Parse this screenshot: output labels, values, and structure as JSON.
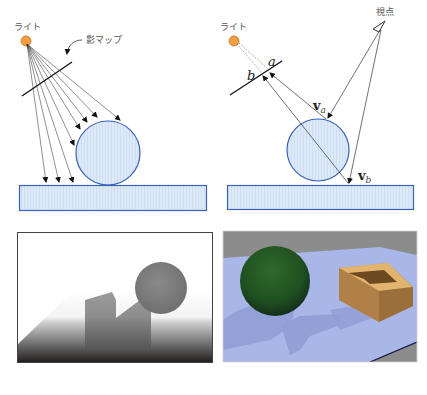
{
  "figure": {
    "top_left": {
      "light_label": "ライト",
      "shadow_map_label": "影マップ"
    },
    "top_right": {
      "light_label": "ライト",
      "viewpoint_label": "視点",
      "sample_a_label": "a",
      "sample_b_label": "b",
      "vector_a_label": "v",
      "vector_a_sub": "a",
      "vector_b_label": "v",
      "vector_b_sub": "b"
    },
    "bottom_left": {
      "description": "depth map (grayscale)"
    },
    "bottom_right": {
      "description": "rendered scene with shadows"
    }
  },
  "colors": {
    "light": "#f0a040",
    "object_fill": "#dbe9f8",
    "object_stroke": "#3a62b5",
    "floor_render": "#a8b6e8",
    "sphere_render": "#2e6a2a",
    "box_render": "#c89a5a"
  }
}
